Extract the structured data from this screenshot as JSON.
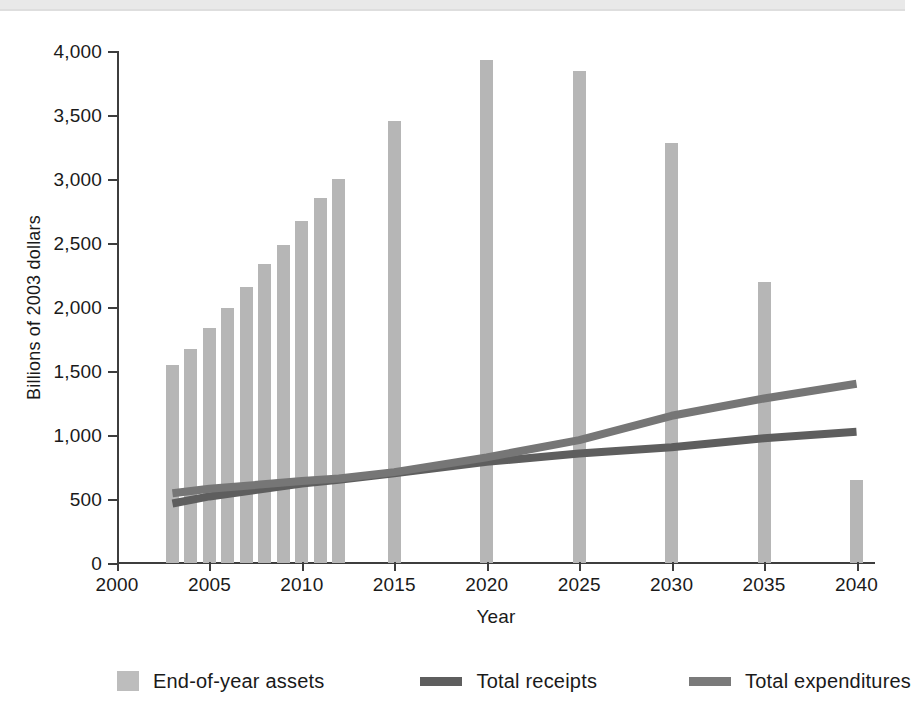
{
  "chart_data": {
    "type": "bar",
    "title": "",
    "subtitle": "",
    "xlabel": "Year",
    "ylabel": "Billions of 2003 dollars",
    "xlim": [
      2000,
      2041
    ],
    "ylim": [
      0,
      4000
    ],
    "grid": false,
    "legend_position": "bottom",
    "x_ticks": [
      "2000",
      "2005",
      "2010",
      "2015",
      "2020",
      "2025",
      "2030",
      "2035",
      "2040"
    ],
    "x_tick_values": [
      2000,
      2005,
      2010,
      2015,
      2020,
      2025,
      2030,
      2035,
      2040
    ],
    "y_ticks": [
      "0",
      "500",
      "1,000",
      "1,500",
      "2,000",
      "2,500",
      "3,000",
      "3,500",
      "4,000"
    ],
    "y_tick_values": [
      0,
      500,
      1000,
      1500,
      2000,
      2500,
      3000,
      3500,
      4000
    ],
    "bar_series": {
      "name": "End-of-year assets",
      "color": "#b6b6b6",
      "x": [
        2003,
        2004,
        2005,
        2006,
        2007,
        2008,
        2009,
        2010,
        2011,
        2012,
        2015,
        2020,
        2025,
        2030,
        2035,
        2040
      ],
      "values": [
        1550,
        1670,
        1835,
        1990,
        2160,
        2335,
        2485,
        2670,
        2850,
        3000,
        3450,
        3930,
        3845,
        3285,
        2195,
        645
      ]
    },
    "series": [
      {
        "name": "Total receipts",
        "type": "line",
        "color": "#5e5e5e",
        "x": [
          2003,
          2005,
          2010,
          2012,
          2015,
          2020,
          2025,
          2030,
          2035,
          2040
        ],
        "values": [
          465,
          520,
          620,
          650,
          700,
          790,
          855,
          905,
          975,
          1025
        ]
      },
      {
        "name": "Total expenditures",
        "type": "line",
        "color": "#767676",
        "x": [
          2003,
          2005,
          2010,
          2012,
          2015,
          2020,
          2025,
          2030,
          2035,
          2040
        ],
        "values": [
          545,
          580,
          640,
          660,
          710,
          825,
          960,
          1150,
          1285,
          1400
        ]
      }
    ]
  },
  "legend": {
    "items": [
      {
        "label": "End-of-year assets",
        "marker": "bar-swatch",
        "color": "#bdbdbd"
      },
      {
        "label": "Total receipts",
        "marker": "line-swatch",
        "color": "#5e5e5e"
      },
      {
        "label": "Total expenditures",
        "marker": "line-swatch",
        "color": "#7a7a7a"
      }
    ]
  },
  "axes": {
    "x_title": "Year",
    "y_title": "Billions of 2003 dollars"
  }
}
